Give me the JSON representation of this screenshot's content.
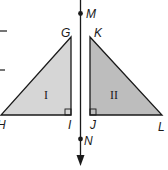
{
  "diagram": {
    "type": "reflection-across-line",
    "colors": {
      "stroke": "#1a1a1a",
      "triangle_I_fill": "#d6d6d6",
      "triangle_II_fill": "#bdbdbd",
      "background": "#ffffff"
    },
    "line": {
      "name": "MN",
      "points": [
        {
          "label": "M"
        },
        {
          "label": "N"
        }
      ]
    },
    "triangle_I": {
      "label": "I",
      "vertices": [
        {
          "label": "G"
        },
        {
          "label": "H"
        },
        {
          "label": "I"
        }
      ],
      "right_angle_at": "I"
    },
    "triangle_II": {
      "label": "II",
      "vertices": [
        {
          "label": "K"
        },
        {
          "label": "J"
        },
        {
          "label": "L"
        }
      ],
      "right_angle_at": "J"
    }
  }
}
